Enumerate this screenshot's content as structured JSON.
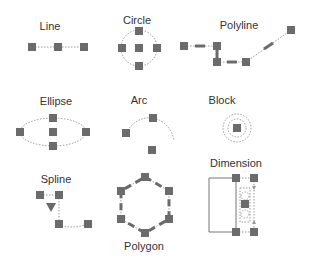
{
  "colors": {
    "grip": "#6b6b6b",
    "dotted": "#9a9a9a",
    "label": "#333333",
    "solid_line": "#777777"
  },
  "items": [
    {
      "id": "line",
      "label": "Line"
    },
    {
      "id": "circle",
      "label": "Circle"
    },
    {
      "id": "polyline",
      "label": "Polyline"
    },
    {
      "id": "ellipse",
      "label": "Ellipse"
    },
    {
      "id": "arc",
      "label": "Arc"
    },
    {
      "id": "block",
      "label": "Block"
    },
    {
      "id": "spline",
      "label": "Spline"
    },
    {
      "id": "polygon",
      "label": "Polygon"
    },
    {
      "id": "dimension",
      "label": "Dimension"
    }
  ],
  "icons": {
    "grip": "square-grip-icon",
    "triangle": "triangle-down-icon"
  }
}
